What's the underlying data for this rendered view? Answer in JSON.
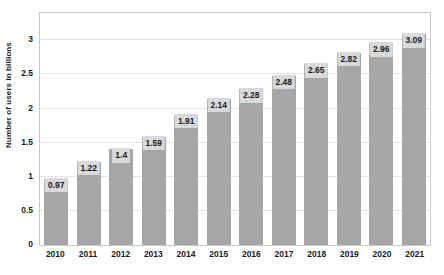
{
  "chart_data": {
    "type": "bar",
    "title": "",
    "subtitle": "",
    "xlabel": "",
    "ylabel": "Number of users in billions",
    "categories": [
      "2010",
      "2011",
      "2012",
      "2013",
      "2014",
      "2015",
      "2016",
      "2017",
      "2018",
      "2019",
      "2020",
      "2021"
    ],
    "values": [
      0.97,
      1.22,
      1.4,
      1.59,
      1.91,
      2.14,
      2.28,
      2.48,
      2.65,
      2.82,
      2.96,
      3.09
    ],
    "value_labels": [
      "0.97",
      "1.22",
      "1.4",
      "1.59",
      "1.91",
      "2.14",
      "2.28",
      "2.48",
      "2.65",
      "2.82",
      "2.96",
      "3.09"
    ],
    "ylim": [
      0,
      3.4
    ],
    "yticks": [
      0,
      0.5,
      1,
      1.5,
      2,
      2.5,
      3
    ],
    "ytick_labels": [
      "0",
      "0.5",
      "1",
      "1.5",
      "2",
      "2.5",
      "3"
    ],
    "grid": true,
    "grid_axis": "y",
    "legend": false,
    "legend_position": "none",
    "bar_color": "#a6a6a6",
    "value_label_bg": "#d9d9d9",
    "text_color": "#1a1a1a",
    "grid_color": "#e2e2e2",
    "plot_border_color": "#c8c8c8",
    "background_color": "#ffffff"
  }
}
